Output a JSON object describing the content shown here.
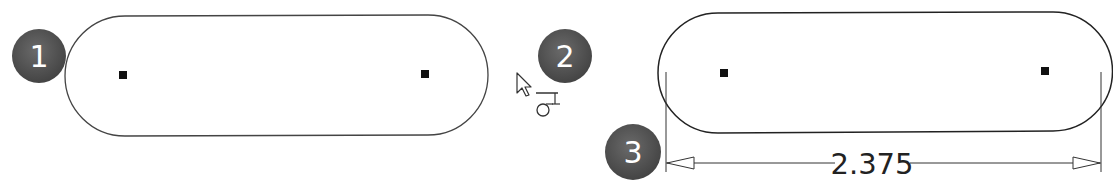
{
  "steps": [
    {
      "number": "1",
      "label": "step-1"
    },
    {
      "number": "2",
      "label": "step-2"
    },
    {
      "number": "3",
      "label": "step-3"
    }
  ],
  "dimension": {
    "value": "2.375"
  },
  "colors": {
    "badge": "#555555",
    "outline": "#333333",
    "point": "#111111"
  }
}
